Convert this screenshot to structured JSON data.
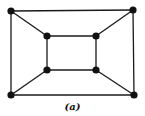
{
  "diagram": {
    "type": "graph",
    "caption": "(a)",
    "colors": {
      "edge": "#1a1a1a",
      "node": "#111111",
      "background": "#ffffff"
    },
    "nodes": [
      {
        "id": "outer-tl",
        "x": 11,
        "y": 11
      },
      {
        "id": "outer-tr",
        "x": 133,
        "y": 10
      },
      {
        "id": "outer-bl",
        "x": 11,
        "y": 95
      },
      {
        "id": "outer-br",
        "x": 134,
        "y": 95
      },
      {
        "id": "inner-tl",
        "x": 47,
        "y": 36
      },
      {
        "id": "inner-tr",
        "x": 96,
        "y": 36
      },
      {
        "id": "inner-bl",
        "x": 47,
        "y": 70
      },
      {
        "id": "inner-br",
        "x": 96,
        "y": 70
      }
    ],
    "edges": [
      [
        "outer-tl",
        "outer-tr"
      ],
      [
        "outer-tr",
        "outer-br"
      ],
      [
        "outer-br",
        "outer-bl"
      ],
      [
        "outer-bl",
        "outer-tl"
      ],
      [
        "inner-tl",
        "inner-tr"
      ],
      [
        "inner-tr",
        "inner-br"
      ],
      [
        "inner-br",
        "inner-bl"
      ],
      [
        "inner-bl",
        "inner-tl"
      ],
      [
        "outer-tl",
        "inner-tl"
      ],
      [
        "outer-tr",
        "inner-tr"
      ],
      [
        "outer-bl",
        "inner-bl"
      ],
      [
        "outer-br",
        "inner-br"
      ]
    ]
  }
}
